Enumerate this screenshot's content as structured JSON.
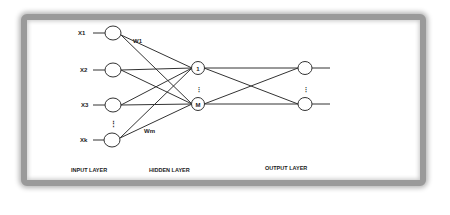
{
  "diagram": {
    "type": "neural-network",
    "input_layer": {
      "label": "INPUT LAYER",
      "nodes": [
        {
          "label": "X1"
        },
        {
          "label": "X2"
        },
        {
          "label": "X3"
        },
        {
          "label": "Xk"
        }
      ],
      "ellipsis": "⋮"
    },
    "hidden_layer": {
      "label": "HIDDEN LAYER",
      "nodes": [
        {
          "label": "1"
        },
        {
          "label": "M"
        }
      ],
      "ellipsis": "⋮"
    },
    "output_layer": {
      "label": "OUTPUT LAYER",
      "nodes": [
        {
          "label": ""
        },
        {
          "label": ""
        }
      ],
      "ellipsis": "⋮"
    },
    "weights": {
      "first": "W1",
      "last": "Wm"
    }
  }
}
